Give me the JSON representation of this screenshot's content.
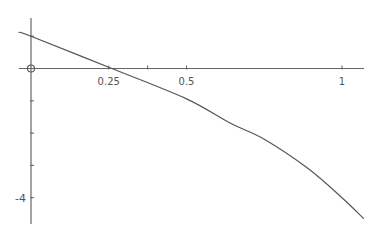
{
  "chart_data": {
    "type": "line",
    "title": "",
    "xlabel": "",
    "ylabel": "",
    "xlim": [
      -0.04,
      1.08
    ],
    "ylim": [
      -4.7,
      1.1
    ],
    "grid": false,
    "legend": null,
    "x_ticks": [
      0.25,
      0.375,
      0.5,
      1
    ],
    "x_tick_labels": [
      "0.25",
      "",
      "0.5",
      "1"
    ],
    "y_ticks": [
      1,
      -1,
      -2,
      -3,
      -4
    ],
    "y_tick_labels": [
      "",
      "",
      "",
      "",
      "-4"
    ],
    "origin_label": "O",
    "series": [
      {
        "name": "f(x)",
        "x": [
          -0.04,
          0,
          0.26,
          0.5,
          0.64,
          0.75,
          0.89,
          1.0,
          1.07
        ],
        "y": [
          1.12,
          1.0,
          0.0,
          -0.94,
          -1.69,
          -2.19,
          -3.09,
          -4.0,
          -4.65
        ]
      }
    ],
    "color": "#555555"
  }
}
